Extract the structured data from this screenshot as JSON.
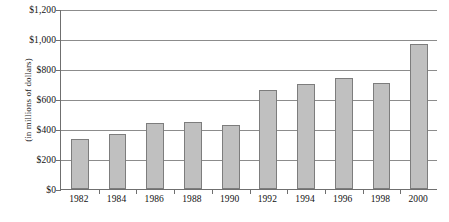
{
  "chart_data": {
    "type": "bar",
    "title": "",
    "subtitle": "",
    "xlabel": "",
    "ylabel": "(in millions of dollars)",
    "categories": [
      "1982",
      "1984",
      "1986",
      "1988",
      "1990",
      "1992",
      "1994",
      "1996",
      "1998",
      "2000"
    ],
    "values": [
      335,
      365,
      440,
      450,
      430,
      660,
      700,
      740,
      710,
      965
    ],
    "ylim": [
      0,
      1200
    ],
    "ytick_values": [
      0,
      200,
      400,
      600,
      800,
      1000,
      1200
    ],
    "ytick_labels": [
      "$0",
      "$200",
      "$400",
      "$600",
      "$800",
      "$1,000",
      "$1,200"
    ],
    "grid": true,
    "grid_axis": "y",
    "legend": false,
    "legend_position": "none",
    "bar_color": "#c0c0c0",
    "bar_border_color": "#7d7d7d",
    "axis_color": "#6f6f6f",
    "gridline_color": "#8c8c8c",
    "background_color": "#ffffff",
    "text_color": "#111111"
  }
}
